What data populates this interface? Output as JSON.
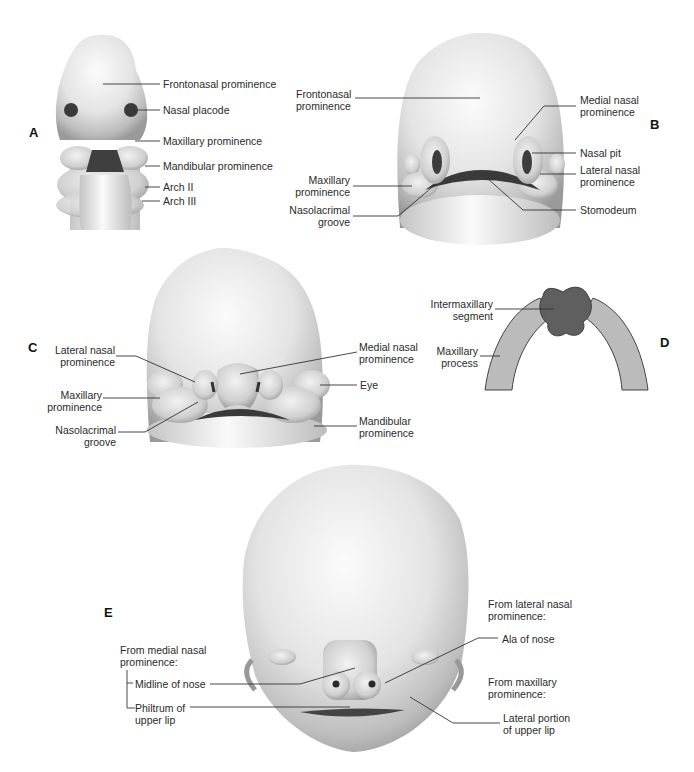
{
  "panels": {
    "A": {
      "letter": "A",
      "labels": {
        "frontonasal": "Frontonasal prominence",
        "nasal_placode": "Nasal placode",
        "maxillary": "Maxillary prominence",
        "mandibular": "Mandibular prominence",
        "arch2": "Arch II",
        "arch3": "Arch III"
      }
    },
    "B": {
      "letter": "B",
      "labels": {
        "frontonasal_1": "Frontonasal",
        "frontonasal_2": "prominence",
        "maxillary_1": "Maxillary",
        "maxillary_2": "prominence",
        "nasolacrimal_1": "Nasolacrimal",
        "nasolacrimal_2": "groove",
        "medial_1": "Medial nasal",
        "medial_2": "prominence",
        "nasal_pit": "Nasal pit",
        "lateral_1": "Lateral nasal",
        "lateral_2": "prominence",
        "stomodeum": "Stomodeum"
      }
    },
    "C": {
      "letter": "C",
      "labels": {
        "lateral_1": "Lateral nasal",
        "lateral_2": "prominence",
        "maxillary_1": "Maxillary",
        "maxillary_2": "prominence",
        "nasolacrimal_1": "Nasolacrimal",
        "nasolacrimal_2": "groove",
        "medial_1": "Medial nasal",
        "medial_2": "prominence",
        "eye": "Eye",
        "mandibular_1": "Mandibular",
        "mandibular_2": "prominence"
      }
    },
    "D": {
      "letter": "D",
      "labels": {
        "intermaxillary_1": "Intermaxillary",
        "intermaxillary_2": "segment",
        "maxillary_1": "Maxillary",
        "maxillary_2": "process"
      }
    },
    "E": {
      "letter": "E",
      "labels": {
        "from_medial_1": "From medial nasal",
        "from_medial_2": "prominence:",
        "midline": "Midline of nose",
        "philtrum_1": "Philtrum of",
        "philtrum_2": "upper lip",
        "from_lateral_1": "From lateral nasal",
        "from_lateral_2": "prominence:",
        "ala": "Ala of nose",
        "from_maxillary_1": "From maxillary",
        "from_maxillary_2": "prominence:",
        "lateral_portion_1": "Lateral portion",
        "lateral_portion_2": "of upper lip"
      }
    }
  },
  "colors": {
    "skin_light": "#f4f4f4",
    "skin_mid": "#c8c8c8",
    "skin_dark": "#8a8a8a",
    "cavity": "#3a3a3a",
    "intermaxillary": "#5f5f5f",
    "maxillary_process": "#b9b9b9"
  }
}
